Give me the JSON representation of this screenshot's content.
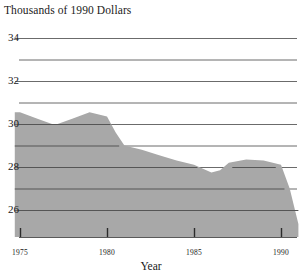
{
  "chart_data": {
    "type": "area",
    "title": "Thousands of 1990 Dollars",
    "xlabel": "Year",
    "ylabel": "",
    "xlim": [
      1974.7,
      1991.0
    ],
    "ylim": [
      25.0,
      34.4
    ],
    "grid": true,
    "legend_position": "none",
    "fill_color": "#a8a8a8",
    "gridline_color": "#555555",
    "ytick_labels": [
      "26",
      "28",
      "30",
      "32",
      "34"
    ],
    "ytick_values": [
      26,
      28,
      30,
      32,
      34
    ],
    "gridline_values": [
      26,
      27,
      28,
      29,
      30,
      31,
      32,
      33,
      34
    ],
    "xtick_labels": [
      "1975",
      "1980",
      "1985",
      "1990"
    ],
    "xtick_values": [
      1975,
      1980,
      1985,
      1990
    ],
    "x": [
      1974.7,
      1975,
      1976,
      1977,
      1978,
      1979,
      1980,
      1980.5,
      1981,
      1982,
      1983,
      1984,
      1985,
      1986,
      1986.5,
      1987,
      1988,
      1989,
      1990,
      1990.5,
      1991
    ],
    "values": [
      30.55,
      30.55,
      30.25,
      29.95,
      30.25,
      30.55,
      30.35,
      29.6,
      29.0,
      28.8,
      28.55,
      28.3,
      28.1,
      27.75,
      27.85,
      28.2,
      28.35,
      28.3,
      28.1,
      27.0,
      25.35
    ],
    "series": [
      {
        "name": "Thousands of 1990 Dollars",
        "values": [
          30.55,
          30.55,
          30.25,
          29.95,
          30.25,
          30.55,
          30.35,
          29.6,
          29.0,
          28.8,
          28.55,
          28.3,
          28.1,
          27.75,
          27.85,
          28.2,
          28.35,
          28.3,
          28.1,
          27.0,
          25.35
        ]
      }
    ],
    "annotations": []
  },
  "yticks": [
    {
      "label": "34"
    },
    {
      "label": "32"
    },
    {
      "label": "30"
    },
    {
      "label": "28"
    },
    {
      "label": "26"
    }
  ],
  "xticks": [
    {
      "label": "1975"
    },
    {
      "label": "1980"
    },
    {
      "label": "1985"
    },
    {
      "label": "1990"
    }
  ]
}
